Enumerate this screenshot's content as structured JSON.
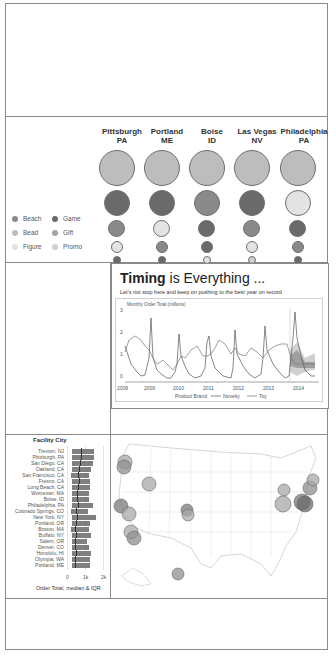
{
  "bubble_panel": {
    "columns": [
      {
        "city": "Pittsburgh",
        "state": "PA"
      },
      {
        "city": "Portland",
        "state": "ME"
      },
      {
        "city": "Boise",
        "state": "ID"
      },
      {
        "city": "Las Vegas",
        "state": "NV"
      },
      {
        "city": "Philadelphia",
        "state": "PA"
      }
    ],
    "legend": [
      {
        "label": "Beach",
        "color": "#8a8a8a"
      },
      {
        "label": "Game",
        "color": "#6a6a6a"
      },
      {
        "label": "Bead",
        "color": "#bdbdbd"
      },
      {
        "label": "Gift",
        "color": "#a3a3a3"
      },
      {
        "label": "Figure",
        "color": "#e3e3e3"
      },
      {
        "label": "Promo",
        "color": "#cfcfcf"
      }
    ]
  },
  "timing_card": {
    "title_bold": "Timing",
    "title_rest": " is Everything ...",
    "subtitle": "Let's not stop here and keep on pushing to the best year on record",
    "y_axis_label": "Monthly Order Total (millions)",
    "legend_title": "Product Brand",
    "legend_items": [
      "Novelty",
      "Toy"
    ]
  },
  "bar_panel": {
    "title": "Facility City",
    "x_axis_title": "Order Total, median & IQR",
    "x_ticks": [
      "0",
      "1k",
      "2k"
    ]
  },
  "chart_data": [
    {
      "type": "scatter",
      "title": "Bubble matrix by facility city and product category",
      "categories": [
        "Pittsburgh PA",
        "Portland ME",
        "Boise ID",
        "Las Vegas NV",
        "Philadelphia PA"
      ],
      "rows": [
        {
          "rank": 1,
          "sizes": [
            1.0,
            1.0,
            1.0,
            1.0,
            1.0
          ],
          "categories_by_col": [
            "Bead",
            "Bead",
            "Bead",
            "Bead",
            "Bead"
          ]
        },
        {
          "rank": 2,
          "sizes": [
            0.68,
            0.68,
            0.68,
            0.68,
            0.68
          ],
          "categories_by_col": [
            "Game",
            "Game",
            "Beach",
            "Game",
            "Figure"
          ]
        },
        {
          "rank": 3,
          "sizes": [
            0.45,
            0.45,
            0.45,
            0.45,
            0.45
          ],
          "categories_by_col": [
            "Beach",
            "Figure",
            "Game",
            "Beach",
            "Game"
          ]
        },
        {
          "rank": 4,
          "sizes": [
            0.32,
            0.32,
            0.32,
            0.32,
            0.32
          ],
          "categories_by_col": [
            "Figure",
            "Beach",
            "Game",
            "Figure",
            "Beach"
          ]
        },
        {
          "rank": 5,
          "sizes": [
            0.22,
            0.22,
            0.22,
            0.22,
            0.22
          ],
          "categories_by_col": [
            "Game",
            "Game",
            "Figure",
            "Promo",
            "Game"
          ]
        }
      ],
      "legend": [
        "Beach",
        "Game",
        "Bead",
        "Gift",
        "Figure",
        "Promo"
      ]
    },
    {
      "type": "line",
      "title": "Timing is Everything ...",
      "subtitle": "Let's not stop here and keep on pushing to the best year on record",
      "ylabel": "Monthly Order Total (millions)",
      "xlabel": "",
      "x_ticks": [
        "2008",
        "2009",
        "2010",
        "2011",
        "2012",
        "2013",
        "2014"
      ],
      "y_ticks": [
        0,
        1,
        2,
        3
      ],
      "ylim": [
        0,
        3.2
      ],
      "legend_title": "Product Brand",
      "series": [
        {
          "name": "Novelty",
          "x": [
            2008.0,
            2008.3,
            2008.6,
            2008.9,
            2009.0,
            2009.1,
            2009.4,
            2009.7,
            2010.0,
            2010.2,
            2010.5,
            2010.8,
            2011.0,
            2011.2,
            2011.5,
            2011.8,
            2012.0,
            2012.2,
            2012.5,
            2012.8,
            2013.0,
            2013.2,
            2013.5,
            2013.8
          ],
          "values": [
            1.5,
            0.6,
            0.3,
            0.5,
            2.9,
            0.8,
            0.5,
            0.3,
            2.1,
            0.9,
            0.4,
            0.3,
            2.4,
            0.9,
            0.4,
            0.3,
            2.9,
            1.0,
            0.5,
            0.3,
            2.8,
            0.9,
            0.4,
            0.2
          ]
        },
        {
          "name": "Toy",
          "x": [
            2008.0,
            2008.3,
            2008.6,
            2008.9,
            2009.0,
            2009.2,
            2009.5,
            2009.8,
            2010.0,
            2010.3,
            2010.6,
            2010.9,
            2011.0,
            2011.3,
            2011.6,
            2011.9,
            2012.0,
            2012.3,
            2012.6,
            2012.9,
            2013.0,
            2013.3,
            2013.6,
            2013.9
          ],
          "values": [
            1.1,
            1.6,
            1.5,
            1.4,
            1.2,
            0.9,
            0.8,
            0.5,
            0.7,
            1.2,
            1.3,
            0.9,
            0.9,
            1.6,
            1.3,
            0.7,
            1.3,
            1.0,
            1.3,
            0.9,
            1.0,
            1.2,
            1.4,
            1.5
          ]
        },
        {
          "name": "Forecast band (2014)",
          "x": [
            2013.9,
            2014.1,
            2014.4,
            2014.7
          ],
          "values": [
            1.1,
            1.2,
            1.1,
            1.1
          ],
          "band_low": [
            0.4,
            0.3,
            0.5,
            0.5
          ],
          "band_high": [
            2.2,
            2.6,
            1.7,
            1.7
          ]
        }
      ],
      "forecast_marker_x": 2013.85
    },
    {
      "type": "bar",
      "title": "Facility City",
      "xlabel": "Order Total, median & IQR",
      "x_ticks": [
        "0",
        "1k",
        "2k"
      ],
      "xlim": [
        0,
        2000
      ],
      "categories": [
        "Trenton, NJ",
        "Pittsburgh, PA",
        "San Diego, CA",
        "Oakland, CA",
        "San Francisco, CA",
        "Fresno, CA",
        "Long Beach, CA",
        "Worcester, MA",
        "Boise, ID",
        "Philadelphia, PA",
        "Colorado Springs, CO",
        "New York, NY",
        "Portland, OR",
        "Boston, MA",
        "Buffalo, NY",
        "Salem, OR",
        "Denver, CO",
        "Honolulu, HI",
        "Olympia, WA",
        "Portland, ME"
      ],
      "series": [
        {
          "name": "Q1",
          "values": [
            300,
            300,
            300,
            300,
            200,
            300,
            300,
            300,
            300,
            300,
            200,
            300,
            300,
            200,
            300,
            300,
            300,
            300,
            300,
            300
          ]
        },
        {
          "name": "Median",
          "values": [
            800,
            750,
            700,
            650,
            600,
            650,
            600,
            550,
            550,
            600,
            500,
            550,
            500,
            450,
            500,
            450,
            450,
            500,
            450,
            450
          ]
        },
        {
          "name": "Q3",
          "values": [
            1500,
            1500,
            1450,
            1350,
            1200,
            1300,
            1300,
            1200,
            1200,
            1450,
            1150,
            1600,
            1300,
            1200,
            1350,
            1100,
            1200,
            1350,
            1300,
            1300
          ]
        }
      ]
    },
    {
      "type": "scatter",
      "title": "US facility map",
      "points": [
        {
          "location": "Olympia, WA"
        },
        {
          "location": "Portland, OR"
        },
        {
          "location": "Salem, OR"
        },
        {
          "location": "Boise, ID"
        },
        {
          "location": "Oakland, CA"
        },
        {
          "location": "San Francisco, CA"
        },
        {
          "location": "Fresno, CA"
        },
        {
          "location": "Long Beach, CA"
        },
        {
          "location": "San Diego, CA"
        },
        {
          "location": "Denver, CO"
        },
        {
          "location": "Colorado Springs, CO"
        },
        {
          "location": "Honolulu, HI"
        },
        {
          "location": "Buffalo, NY"
        },
        {
          "location": "Pittsburgh, PA"
        },
        {
          "location": "Philadelphia, PA"
        },
        {
          "location": "Trenton, NJ"
        },
        {
          "location": "New York, NY"
        },
        {
          "location": "Worcester, MA"
        },
        {
          "location": "Boston, MA"
        },
        {
          "location": "Portland, ME"
        }
      ]
    }
  ]
}
